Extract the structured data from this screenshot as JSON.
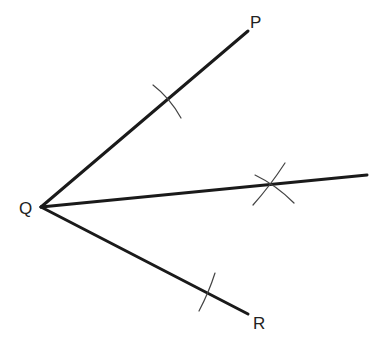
{
  "diagram": {
    "points": {
      "P": {
        "label": "P",
        "x": 248,
        "y": 31,
        "label_x": 250,
        "label_y": 28
      },
      "Q": {
        "label": "Q",
        "x": 41,
        "y": 207,
        "label_x": 19,
        "label_y": 214
      },
      "R": {
        "label": "R",
        "x": 248,
        "y": 314,
        "label_x": 253,
        "label_y": 329
      }
    },
    "bisector_end": {
      "x": 367,
      "y": 175
    },
    "colors": {
      "line": "#1a1a1a",
      "arc": "#444444",
      "background": "#ffffff"
    }
  }
}
